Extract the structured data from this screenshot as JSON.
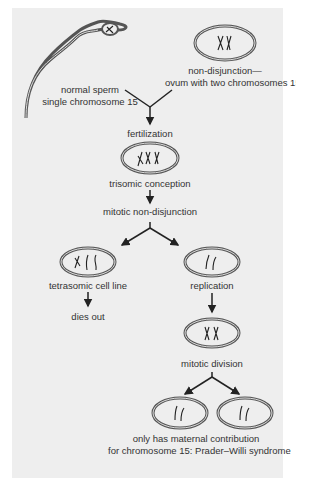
{
  "diagram": {
    "type": "flowchart",
    "colors": {
      "background": "#eeeeee",
      "margin": "#ffffff",
      "stroke": "#333333",
      "text": "#333333"
    },
    "nodes": {
      "sperm": {
        "line1": "normal sperm",
        "line2": "single chromosome 15"
      },
      "ovum": {
        "line1": "non-disjunction—",
        "line2": "ovum with two chromosomes 15s"
      },
      "fertilization": {
        "label": "fertilization"
      },
      "trisomic": {
        "label": "trisomic conception"
      },
      "mitotic_nd": {
        "label": "mitotic non-disjunction"
      },
      "tetrasomic": {
        "label": "tetrasomic cell line"
      },
      "dies_out": {
        "label": "dies out"
      },
      "replication": {
        "label": "replication"
      },
      "mitotic_division": {
        "label": "mitotic division"
      },
      "outcome": {
        "line1": "only has maternal contribution",
        "line2": "for chromosome 15: Prader–Willi syndrome"
      }
    },
    "edges": [
      [
        "sperm",
        "fertilization"
      ],
      [
        "ovum",
        "fertilization"
      ],
      [
        "fertilization",
        "trisomic"
      ],
      [
        "trisomic",
        "mitotic_nd"
      ],
      [
        "mitotic_nd",
        "tetrasomic"
      ],
      [
        "mitotic_nd",
        "replication"
      ],
      [
        "tetrasomic",
        "dies_out"
      ],
      [
        "replication",
        "mitotic_division"
      ],
      [
        "mitotic_division",
        "outcome"
      ]
    ]
  }
}
